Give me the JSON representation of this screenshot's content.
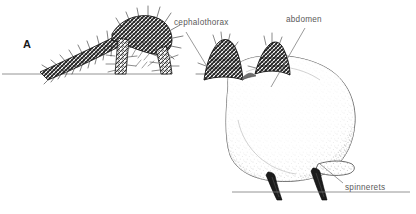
{
  "figure": {
    "panel_label": "A",
    "medium": "pen-and-ink-stipple-drawing",
    "background_color": "#ffffff",
    "ink_color": "#1a1a1a",
    "label_color": "#5a5a5a",
    "leader_color": "#6e6e6e",
    "baseline_color": "#7a7a7a"
  },
  "labels": [
    {
      "id": "cephalothorax",
      "text": "cephalothorax",
      "text_x": 174,
      "text_y": 25,
      "leader": {
        "x1": 186,
        "y1": 32,
        "x2": 211,
        "y2": 73
      }
    },
    {
      "id": "abdomen",
      "text": "abdomen",
      "text_x": 286,
      "text_y": 22,
      "leader": {
        "x1": 305,
        "y1": 28,
        "x2": 271,
        "y2": 87
      }
    },
    {
      "id": "spinnerets",
      "text": "spinnerets",
      "text_x": 345,
      "text_y": 190,
      "leader": {
        "x1": 343,
        "y1": 183,
        "x2": 320,
        "y2": 164
      }
    }
  ],
  "baselines": [
    {
      "id": "upper-left-ground",
      "x1": 2,
      "y1": 74,
      "x2": 168,
      "y2": 74
    },
    {
      "id": "lower-right-ground",
      "x1": 232,
      "y1": 192,
      "x2": 410,
      "y2": 192
    }
  ],
  "anatomy_parts": [
    {
      "id": "front-legs",
      "name": "hairy arched front legs",
      "region": "left"
    },
    {
      "id": "cephalothorax-tubercles",
      "name": "dark peaked tubercles",
      "region": "upper-center"
    },
    {
      "id": "abdomen-body",
      "name": "large stippled abdomen",
      "region": "center-right"
    },
    {
      "id": "spinneret-pair",
      "name": "two tapered spinnerets",
      "region": "lower-right"
    }
  ]
}
